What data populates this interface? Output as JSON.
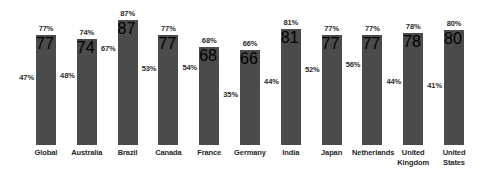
{
  "chart_data": {
    "type": "bar",
    "title": "",
    "subtitle": "",
    "xlabel": "",
    "ylabel": "",
    "ylim": [
      0,
      100
    ],
    "grid": false,
    "legend": "none",
    "value_suffix": "%",
    "categories": [
      "Global",
      "Australia",
      "Brazil",
      "Canada",
      "France",
      "Germany",
      "India",
      "Japan",
      "Netherlands",
      "United\nKingdom",
      "United\nStates"
    ],
    "series": [
      {
        "name": "bar-value",
        "role": "bar",
        "values": [
          77,
          74,
          87,
          77,
          68,
          66,
          81,
          77,
          77,
          78,
          80
        ],
        "labels": [
          "77%",
          "74%",
          "87%",
          "77%",
          "68%",
          "66%",
          "81%",
          "77%",
          "77%",
          "78%",
          "80%"
        ]
      },
      {
        "name": "secondary-value",
        "role": "inner-label",
        "values": [
          47,
          48,
          67,
          53,
          54,
          35,
          44,
          52,
          56,
          44,
          41
        ],
        "labels": [
          "47%",
          "48%",
          "67%",
          "53%",
          "54%",
          "35%",
          "44%",
          "52%",
          "56%",
          "44%",
          "41%"
        ]
      }
    ],
    "colors": {
      "bar": "#4b4b4b",
      "background": "#ffffff",
      "label_text": "#2b2b2b",
      "category_text": "#1f1f1f"
    }
  }
}
